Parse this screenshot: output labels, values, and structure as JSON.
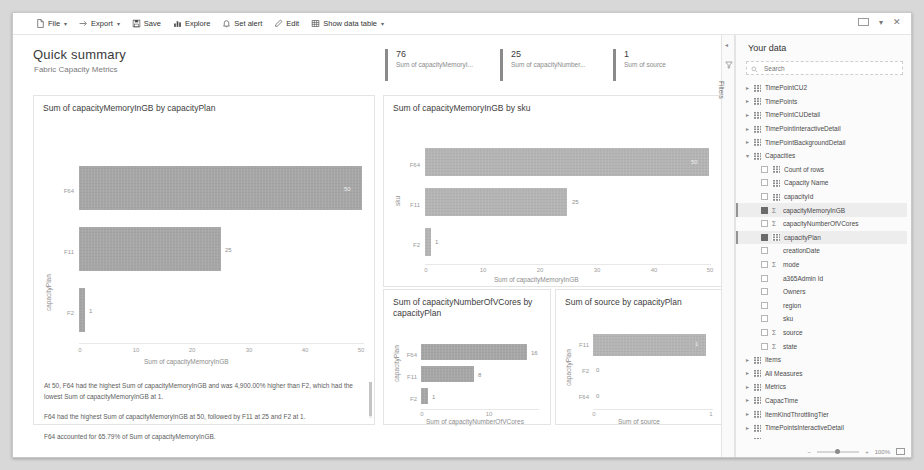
{
  "window": {
    "restore_icon": "restore-window-icon",
    "close_icon": "close-window-icon"
  },
  "toolbar": {
    "items": [
      {
        "label": "File",
        "icon": "file-icon",
        "caret": true
      },
      {
        "label": "Export",
        "icon": "export-icon",
        "caret": true
      },
      {
        "label": "Save",
        "icon": "save-icon",
        "caret": false
      },
      {
        "label": "Explore",
        "icon": "explore-icon",
        "caret": false
      },
      {
        "label": "Set alert",
        "icon": "bell-icon",
        "caret": false
      },
      {
        "label": "Edit",
        "icon": "pencil-icon",
        "caret": false
      },
      {
        "label": "Show data table",
        "icon": "table-icon",
        "caret": true
      }
    ]
  },
  "report": {
    "title": "Quick summary",
    "subtitle": "Fabric Capacity Metrics"
  },
  "kpis": [
    {
      "value": "76",
      "label": "Sum of capacityMemoryI..."
    },
    {
      "value": "25",
      "label": "Sum of capacityNumber..."
    },
    {
      "value": "1",
      "label": "Sum of source"
    }
  ],
  "chart_data": [
    {
      "id": "memory_by_plan",
      "type": "bar",
      "orientation": "horizontal",
      "title": "Sum of capacityMemoryInGB by capacityPlan",
      "categories": [
        "F64",
        "F11",
        "F2"
      ],
      "values": [
        50,
        25,
        1
      ],
      "value_labels": [
        "50",
        "25",
        "1"
      ],
      "xlabel": "Sum of capacityMemoryInGB",
      "ylabel": "capacityPlan",
      "xticks": [
        "0",
        "10",
        "20",
        "30",
        "40",
        "50"
      ],
      "xlim": [
        0,
        52
      ],
      "grid": false,
      "legend": "none"
    },
    {
      "id": "memory_by_sku",
      "type": "bar",
      "orientation": "horizontal",
      "title": "Sum of capacityMemoryInGB by sku",
      "categories": [
        "F64",
        "F11",
        "F2"
      ],
      "values": [
        50,
        25,
        1
      ],
      "value_labels": [
        "50",
        "25",
        "1"
      ],
      "xlabel": "Sum of capacityMemoryInGB",
      "ylabel": "sku",
      "xticks": [
        "0",
        "10",
        "20",
        "30",
        "40",
        "50"
      ],
      "xlim": [
        0,
        52
      ],
      "grid": false,
      "legend": "none"
    },
    {
      "id": "vcores_by_plan",
      "type": "bar",
      "orientation": "horizontal",
      "title": "Sum of capacityNumberOfVCores by capacityPlan",
      "categories": [
        "F64",
        "F11",
        "F2"
      ],
      "values": [
        16,
        8,
        1
      ],
      "value_labels": [
        "16",
        "8",
        "1"
      ],
      "xlabel": "Sum of capacityNumberOfVCores",
      "ylabel": "capacityPlan",
      "xticks": [
        "0",
        "10"
      ],
      "xlim": [
        0,
        18
      ],
      "grid": false,
      "legend": "none"
    },
    {
      "id": "source_by_plan",
      "type": "bar",
      "orientation": "horizontal",
      "title": "Sum of source by capacityPlan",
      "categories": [
        "F11",
        "F2",
        "F64"
      ],
      "values": [
        1,
        0,
        0
      ],
      "value_labels": [
        "1",
        "0",
        "0"
      ],
      "xlabel": "Sum of source",
      "ylabel": "capacityPlan",
      "xticks": [
        "0",
        "1"
      ],
      "xlim": [
        0,
        1.08
      ],
      "grid": false,
      "legend": "none"
    }
  ],
  "insights": [
    "At 50, F64 had the highest Sum of capacityMemoryInGB and was 4,900.00% higher than F2, which had the lowest Sum of capacityMemoryInGB at 1.",
    "F64 had the highest Sum of capacityMemoryInGB at 50, followed by F11 at 25 and F2 at 1.",
    "F64 accounted for 65.79% of Sum of capacityMemoryInGB."
  ],
  "filters": {
    "label": "Filters",
    "expand_icon": "chevron-left-icon",
    "funnel_icon": "funnel-icon"
  },
  "data_pane": {
    "title": "Your data",
    "search_placeholder": "Search",
    "search_value": "",
    "search_icon": "search-icon",
    "items": [
      {
        "label": "TimePointCU2",
        "kind": "table",
        "indent": 0,
        "chevron": true,
        "checked": false,
        "selected": false
      },
      {
        "label": "TimePoints",
        "kind": "table",
        "indent": 0,
        "chevron": true,
        "checked": false,
        "selected": false
      },
      {
        "label": "TimePointCUDetail",
        "kind": "table",
        "indent": 0,
        "chevron": true,
        "checked": false,
        "selected": false
      },
      {
        "label": "TimePointInteractiveDetail",
        "kind": "table",
        "indent": 0,
        "chevron": true,
        "checked": false,
        "selected": false
      },
      {
        "label": "TimePointBackgroundDetail",
        "kind": "table",
        "indent": 0,
        "chevron": true,
        "checked": false,
        "selected": false
      },
      {
        "label": "Capacities",
        "kind": "table",
        "indent": 0,
        "chevron": true,
        "checked": false,
        "selected": false,
        "expanded": true
      },
      {
        "label": "Count of rows",
        "kind": "field",
        "indent": 1,
        "chevron": false,
        "checked": false,
        "selected": false
      },
      {
        "label": "Capacity Name",
        "kind": "field",
        "indent": 1,
        "chevron": false,
        "checked": false,
        "selected": false
      },
      {
        "label": "capacityId",
        "kind": "field",
        "indent": 1,
        "chevron": false,
        "checked": false,
        "selected": false
      },
      {
        "label": "capacityMemoryInGB",
        "kind": "measure",
        "indent": 1,
        "chevron": false,
        "checked": true,
        "selected": true
      },
      {
        "label": "capacityNumberOfVCores",
        "kind": "measure",
        "indent": 1,
        "chevron": false,
        "checked": false,
        "selected": false
      },
      {
        "label": "capacityPlan",
        "kind": "field",
        "indent": 1,
        "chevron": false,
        "checked": true,
        "selected": true
      },
      {
        "label": "creationDate",
        "kind": "plain",
        "indent": 1,
        "chevron": false,
        "checked": false,
        "selected": false
      },
      {
        "label": "mode",
        "kind": "measure",
        "indent": 1,
        "chevron": false,
        "checked": false,
        "selected": false
      },
      {
        "label": "a365Admin Id",
        "kind": "plain",
        "indent": 1,
        "chevron": false,
        "checked": false,
        "selected": false
      },
      {
        "label": "Owners",
        "kind": "plain",
        "indent": 1,
        "chevron": false,
        "checked": false,
        "selected": false
      },
      {
        "label": "region",
        "kind": "plain",
        "indent": 1,
        "chevron": false,
        "checked": false,
        "selected": false
      },
      {
        "label": "sku",
        "kind": "plain",
        "indent": 1,
        "chevron": false,
        "checked": false,
        "selected": false
      },
      {
        "label": "source",
        "kind": "measure",
        "indent": 1,
        "chevron": false,
        "checked": false,
        "selected": false
      },
      {
        "label": "state",
        "kind": "measure",
        "indent": 1,
        "chevron": false,
        "checked": false,
        "selected": false
      },
      {
        "label": "Items",
        "kind": "table",
        "indent": 0,
        "chevron": true,
        "checked": false,
        "selected": false
      },
      {
        "label": "All Measures",
        "kind": "table",
        "indent": 0,
        "chevron": true,
        "checked": false,
        "selected": false
      },
      {
        "label": "Metrics",
        "kind": "table",
        "indent": 0,
        "chevron": true,
        "checked": false,
        "selected": false
      },
      {
        "label": "CapacTime",
        "kind": "table",
        "indent": 0,
        "chevron": true,
        "checked": false,
        "selected": false
      },
      {
        "label": "ItemKindThrottlingTier",
        "kind": "table",
        "indent": 0,
        "chevron": true,
        "checked": false,
        "selected": false
      },
      {
        "label": "TimePointsInteractiveDetail",
        "kind": "table",
        "indent": 0,
        "chevron": true,
        "checked": false,
        "selected": false
      },
      {
        "label": "TimePointsBackgroundDetail",
        "kind": "table",
        "indent": 0,
        "chevron": true,
        "checked": false,
        "selected": false
      }
    ],
    "zoom_level": "100%",
    "fit_icon": "fit-to-page-icon"
  },
  "colors": {
    "bar": "#a6a6a6",
    "bar_light": "#b4b4b4",
    "accent": "#8a8a8a",
    "panel_border": "#e4e4e4"
  }
}
